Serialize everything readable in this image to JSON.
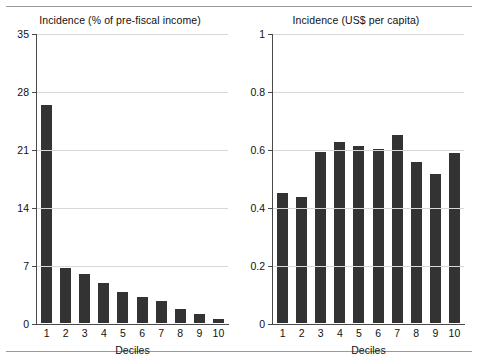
{
  "page": {
    "background_color": "#ffffff",
    "bar_color": "#333333",
    "axis_color": "#4a4a4a",
    "grid_color": "#d8d8d8",
    "rule_color": "#9a9a9a"
  },
  "chart_data": [
    {
      "type": "bar",
      "title": "Incidence (% of pre-fiscal income)",
      "xlabel": "Deciles",
      "ylabel": "",
      "categories": [
        "1",
        "2",
        "3",
        "4",
        "5",
        "6",
        "7",
        "8",
        "9",
        "10"
      ],
      "values": [
        26.3,
        6.6,
        5.9,
        4.8,
        3.8,
        3.1,
        2.6,
        1.7,
        1.1,
        0.5
      ],
      "ylim": [
        0,
        35
      ],
      "yticks": [
        0,
        7,
        14,
        21,
        28,
        35
      ],
      "ytick_labels": [
        "0",
        "7",
        "14",
        "21",
        "28",
        "35"
      ],
      "grid": true,
      "legend": "none"
    },
    {
      "type": "bar",
      "title": "Incidence (US$ per capita)",
      "xlabel": "Deciles",
      "ylabel": "",
      "categories": [
        "1",
        "2",
        "3",
        "4",
        "5",
        "6",
        "7",
        "8",
        "9",
        "10"
      ],
      "values": [
        0.45,
        0.435,
        0.59,
        0.625,
        0.61,
        0.6,
        0.65,
        0.555,
        0.515,
        0.585
      ],
      "ylim": [
        0,
        1
      ],
      "yticks": [
        0,
        0.2,
        0.4,
        0.6,
        0.8,
        1
      ],
      "ytick_labels": [
        "0",
        "0.2",
        "0.4",
        "0.6",
        "0.8",
        "1"
      ],
      "grid": true,
      "legend": "none"
    }
  ]
}
